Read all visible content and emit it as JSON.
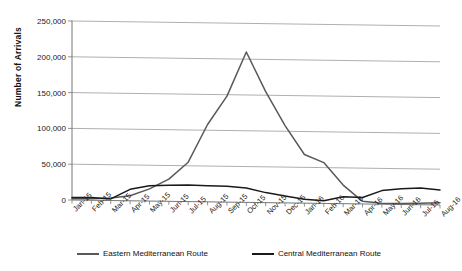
{
  "chart_data": {
    "type": "line",
    "title": "",
    "xlabel": "",
    "ylabel": "Number of Arrivals",
    "ylim": [
      0,
      250000
    ],
    "ytick_labels": [
      "0",
      "50,000",
      "100,000",
      "150,000",
      "200,000",
      "250,000"
    ],
    "ytick_values": [
      0,
      50000,
      100000,
      150000,
      200000,
      250000
    ],
    "grid": true,
    "legend_position": "bottom",
    "categories": [
      "Jan-15",
      "Feb-15",
      "Mar-15",
      "Apr-15",
      "May-15",
      "Jun-15",
      "Jul-15",
      "Aug-15",
      "Sep-15",
      "Oct-15",
      "Nov-15",
      "Dec-15",
      "Jan-16",
      "Feb-16",
      "Mar-16",
      "Apr-16",
      "May-16",
      "Jun-16",
      "Jul-16",
      "Aug-16"
    ],
    "series": [
      {
        "name": "Eastern Mediterranean Route",
        "color": "#595959",
        "values": [
          1700,
          2200,
          3500,
          7000,
          17000,
          31000,
          55000,
          108000,
          148000,
          210000,
          155000,
          108000,
          68000,
          57000,
          26000,
          3600,
          1500,
          1500,
          2000,
          3000
        ]
      },
      {
        "name": "Central Mediterranean Route",
        "color": "#1a1a1a",
        "values": [
          3500,
          4000,
          2300,
          16000,
          21500,
          22500,
          23000,
          22500,
          22000,
          20000,
          14000,
          9500,
          5500,
          3800,
          9600,
          9100,
          19000,
          22000,
          23500,
          21000
        ]
      }
    ]
  },
  "legend": {
    "items": [
      {
        "label": "Eastern Mediterranean Route",
        "color": "#595959"
      },
      {
        "label": "Central Mediterranean Route",
        "color": "#1a1a1a"
      }
    ]
  }
}
